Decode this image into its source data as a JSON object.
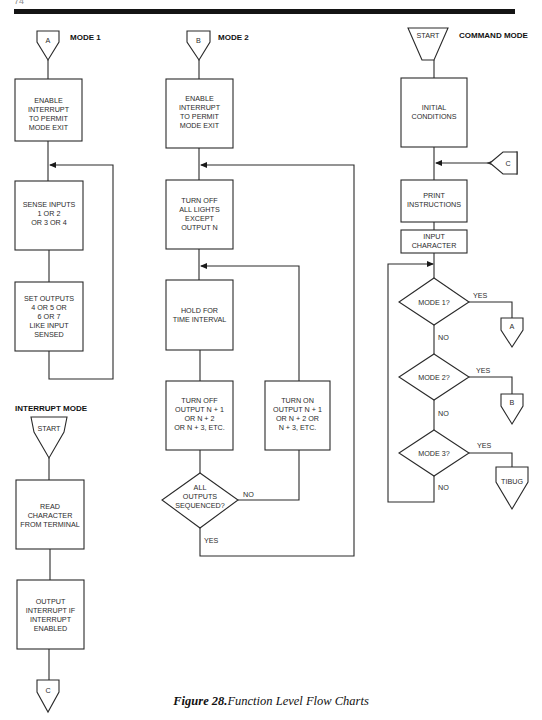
{
  "page": {
    "number_fragment": "74"
  },
  "caption": {
    "figure_label": "Figure 28.",
    "title": "Function Level Flow Charts"
  },
  "flowcharts": {
    "mode1": {
      "title": "MODE 1",
      "entry_connector": "A",
      "steps": [
        [
          "ENABLE",
          "INTERRUPT",
          "TO PERMIT",
          "MODE EXIT"
        ],
        [
          "SENSE INPUTS",
          "1 OR 2",
          "OR 3 OR 4"
        ],
        [
          "SET OUTPUTS",
          "4 OR 5 OR",
          "6 OR 7",
          "LIKE INPUT",
          "SENSED"
        ]
      ]
    },
    "interrupt_mode": {
      "title": "INTERRUPT MODE",
      "entry_connector": "START",
      "steps": [
        [
          "READ",
          "CHARACTER",
          "FROM TERMINAL"
        ],
        [
          "OUTPUT",
          "INTERRUPT IF",
          "INTERRUPT",
          "ENABLED"
        ]
      ],
      "exit_connector": "C"
    },
    "mode2": {
      "title": "MODE 2",
      "entry_connector": "B",
      "steps": [
        [
          "ENABLE",
          "INTERRUPT",
          "TO PERMIT",
          "MODE EXIT"
        ],
        [
          "TURN OFF",
          "ALL LIGHTS",
          "EXCEPT",
          "OUTPUT N"
        ],
        [
          "HOLD FOR",
          "TIME INTERVAL"
        ],
        [
          "TURN OFF",
          "OUTPUT N + 1",
          "OR N + 2",
          "OR  N + 3, ETC."
        ]
      ],
      "decision": [
        "ALL",
        "OUTPUTS",
        "SEQUENCED?"
      ],
      "decision_no_label": "NO",
      "decision_yes_label": "YES",
      "no_branch_step": [
        "TURN ON",
        "OUTPUT N + 1",
        "OR N + 2 OR",
        "N + 3, ETC."
      ]
    },
    "command_mode": {
      "title": "COMMAND MODE",
      "entry_connector": "START",
      "steps": [
        [
          "INITIAL",
          "CONDITIONS"
        ],
        [
          "PRINT",
          "INSTRUCTIONS"
        ],
        [
          "INPUT",
          "CHARACTER"
        ]
      ],
      "reentry_connector": "C",
      "decisions": [
        {
          "text": "MODE 1?",
          "yes_label": "YES",
          "no_label": "NO",
          "yes_target": "A"
        },
        {
          "text": "MODE 2?",
          "yes_label": "YES",
          "no_label": "NO",
          "yes_target": "B"
        },
        {
          "text": "MODE 3?",
          "yes_label": "YES",
          "no_label": "NO",
          "yes_target": "TIBUG"
        }
      ]
    }
  }
}
